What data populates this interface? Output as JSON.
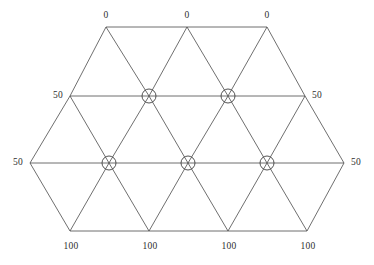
{
  "figure": {
    "title": "",
    "background_color": "#ffffff",
    "line_color": "#4a4a4a",
    "text_color": "#2e2e2e",
    "marker_shape": "circled-cross"
  },
  "labels": {
    "top": [
      {
        "text": "0",
        "x": 106,
        "y": 16
      },
      {
        "text": "0",
        "x": 187,
        "y": 16
      },
      {
        "text": "0",
        "x": 267,
        "y": 16
      }
    ],
    "upper_sides": [
      {
        "text": "50",
        "x": 58,
        "y": 96
      },
      {
        "text": "50",
        "x": 317,
        "y": 96
      }
    ],
    "middle_sides": [
      {
        "text": "50",
        "x": 18,
        "y": 163
      },
      {
        "text": "50",
        "x": 356,
        "y": 163
      }
    ],
    "bottom": [
      {
        "text": "100",
        "x": 71,
        "y": 247
      },
      {
        "text": "100",
        "x": 150,
        "y": 247
      },
      {
        "text": "100",
        "x": 229,
        "y": 247
      },
      {
        "text": "100",
        "x": 308,
        "y": 247
      }
    ]
  },
  "chart_data": {
    "type": "diagram",
    "subtype": "triangular-mesh",
    "title": "",
    "xlabel": "",
    "ylabel": "",
    "grid": false,
    "legend": null,
    "rows": [
      {
        "index": 0,
        "y": 27,
        "x_values": [
          106,
          187,
          267
        ],
        "boundary_label": "0"
      },
      {
        "index": 1,
        "y": 96,
        "x_values": [
          70,
          109,
          149,
          188,
          228,
          267,
          305
        ],
        "boundary_label": "50"
      },
      {
        "index": 2,
        "y": 163,
        "x_values": [
          30,
          70,
          109,
          149,
          188,
          228,
          267,
          305,
          344
        ],
        "boundary_label": "50"
      },
      {
        "index": 3,
        "y": 231,
        "x_values": [
          70,
          149,
          228,
          307
        ],
        "boundary_label": "100"
      }
    ],
    "horizontal_lines": [
      {
        "name": "top-edge",
        "x1": 106,
        "y1": 27,
        "x2": 267,
        "y2": 27
      },
      {
        "name": "upper-row",
        "x1": 70,
        "y1": 96,
        "x2": 305,
        "y2": 96
      },
      {
        "name": "middle-row",
        "x1": 30,
        "y1": 163,
        "x2": 344,
        "y2": 163
      },
      {
        "name": "bottom-edge",
        "x1": 70,
        "y1": 231,
        "x2": 307,
        "y2": 231
      }
    ],
    "diagonal_lines": [
      {
        "x1": 106,
        "y1": 27,
        "x2": 70,
        "y2": 96
      },
      {
        "x1": 106,
        "y1": 27,
        "x2": 149,
        "y2": 96
      },
      {
        "x1": 187,
        "y1": 27,
        "x2": 149,
        "y2": 96
      },
      {
        "x1": 187,
        "y1": 27,
        "x2": 228,
        "y2": 96
      },
      {
        "x1": 267,
        "y1": 27,
        "x2": 228,
        "y2": 96
      },
      {
        "x1": 267,
        "y1": 27,
        "x2": 305,
        "y2": 96
      },
      {
        "x1": 70,
        "y1": 96,
        "x2": 30,
        "y2": 163
      },
      {
        "x1": 70,
        "y1": 96,
        "x2": 109,
        "y2": 163
      },
      {
        "x1": 149,
        "y1": 96,
        "x2": 109,
        "y2": 163
      },
      {
        "x1": 149,
        "y1": 96,
        "x2": 188,
        "y2": 163
      },
      {
        "x1": 228,
        "y1": 96,
        "x2": 188,
        "y2": 163
      },
      {
        "x1": 228,
        "y1": 96,
        "x2": 267,
        "y2": 163
      },
      {
        "x1": 305,
        "y1": 96,
        "x2": 267,
        "y2": 163
      },
      {
        "x1": 305,
        "y1": 96,
        "x2": 344,
        "y2": 163
      },
      {
        "x1": 30,
        "y1": 163,
        "x2": 70,
        "y2": 231
      },
      {
        "x1": 109,
        "y1": 163,
        "x2": 70,
        "y2": 231
      },
      {
        "x1": 109,
        "y1": 163,
        "x2": 149,
        "y2": 231
      },
      {
        "x1": 188,
        "y1": 163,
        "x2": 149,
        "y2": 231
      },
      {
        "x1": 188,
        "y1": 163,
        "x2": 228,
        "y2": 231
      },
      {
        "x1": 267,
        "y1": 163,
        "x2": 228,
        "y2": 231
      },
      {
        "x1": 267,
        "y1": 163,
        "x2": 307,
        "y2": 231
      },
      {
        "x1": 344,
        "y1": 163,
        "x2": 307,
        "y2": 231
      }
    ],
    "marked_nodes": [
      {
        "x": 149,
        "y": 96,
        "r": 7
      },
      {
        "x": 228,
        "y": 96,
        "r": 7
      },
      {
        "x": 109,
        "y": 163,
        "r": 7
      },
      {
        "x": 188,
        "y": 163,
        "r": 7
      },
      {
        "x": 267,
        "y": 163,
        "r": 7
      }
    ]
  }
}
